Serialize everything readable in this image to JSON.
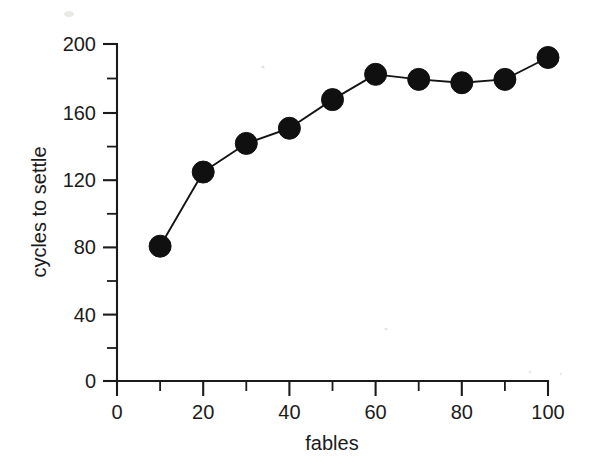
{
  "chart_data": {
    "type": "line",
    "title": "",
    "subtitle": "",
    "xlabel": "fables",
    "ylabel": "cycles to settle",
    "x": [
      10,
      20,
      30,
      40,
      50,
      60,
      70,
      80,
      90,
      100
    ],
    "values": [
      80,
      124,
      141,
      150,
      167,
      182,
      179,
      177,
      179,
      192
    ],
    "series": [
      {
        "name": "cycles to settle",
        "x": [
          10,
          20,
          30,
          40,
          50,
          60,
          70,
          80,
          90,
          100
        ],
        "values": [
          80,
          124,
          141,
          150,
          167,
          182,
          179,
          177,
          179,
          192
        ]
      }
    ],
    "xlim": [
      0,
      100
    ],
    "ylim": [
      0,
      200
    ],
    "x_ticks": [
      0,
      20,
      40,
      60,
      80,
      100
    ],
    "x_tick_labels": [
      "0",
      "20",
      "40",
      "60",
      "80",
      "100"
    ],
    "x_minor_ticks": [
      10,
      30,
      50,
      70,
      90
    ],
    "y_ticks": [
      0,
      40,
      80,
      120,
      160,
      200
    ],
    "y_tick_labels": [
      "0",
      "40",
      "80",
      "120",
      "160",
      "200"
    ],
    "y_minor_ticks": [
      20,
      60,
      100,
      140,
      180
    ],
    "grid": false,
    "legend": false,
    "legend_position": "none",
    "marker": "filled-circle",
    "marker_color": "#101010",
    "line_color": "#141414",
    "background_color": "#ffffff",
    "axis_color": "#1b1b1b",
    "annotations": []
  },
  "axes": {
    "y_title": "cycles to settle",
    "x_title": "fables",
    "y_labels": {
      "t0": "0",
      "t40": "40",
      "t80": "80",
      "t120": "120",
      "t160": "160",
      "t200": "200"
    },
    "x_labels": {
      "t0": "0",
      "t20": "20",
      "t40": "40",
      "t60": "60",
      "t80": "80",
      "t100": "100"
    }
  }
}
